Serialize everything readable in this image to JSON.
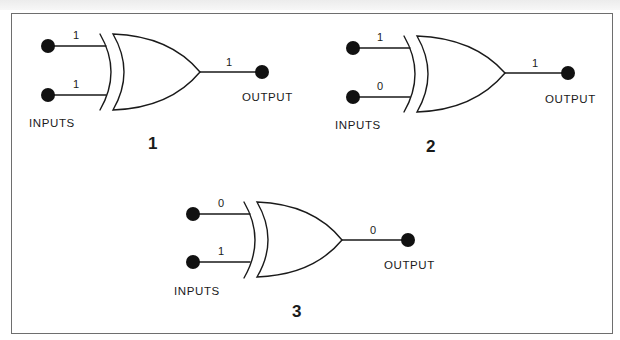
{
  "diagram": {
    "type": "xor-gate-truth-examples",
    "stroke_color": "#1a1a1a",
    "border_color": "#6e6e6e",
    "gates": [
      {
        "id": "1",
        "number_label": "1",
        "inputs": [
          "1",
          "1"
        ],
        "output": "1",
        "inputs_caption": "INPUTS",
        "output_caption": "OUTPUT"
      },
      {
        "id": "2",
        "number_label": "2",
        "inputs": [
          "1",
          "0"
        ],
        "output": "1",
        "inputs_caption": "INPUTS",
        "output_caption": "OUTPUT"
      },
      {
        "id": "3",
        "number_label": "3",
        "inputs": [
          "0",
          "1"
        ],
        "output": "0",
        "inputs_caption": "INPUTS",
        "output_caption": "OUTPUT"
      }
    ]
  }
}
